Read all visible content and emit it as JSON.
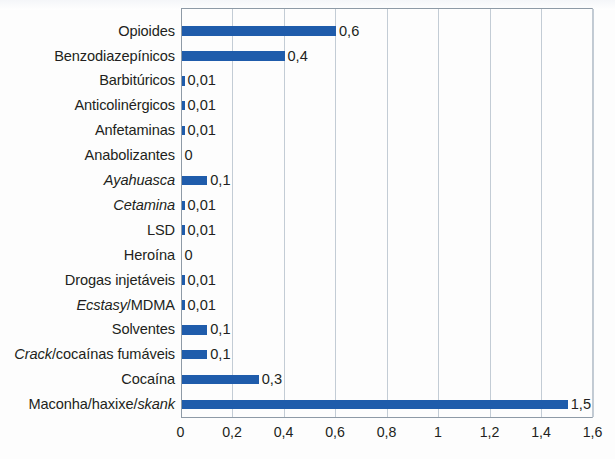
{
  "chart_data": {
    "type": "bar",
    "orientation": "horizontal",
    "title": "",
    "subtitle": "",
    "xlabel": "",
    "ylabel": "",
    "xlim": [
      0,
      1.6
    ],
    "xticks": [
      "0",
      "0,2",
      "0,4",
      "0,6",
      "0,8",
      "1",
      "1,2",
      "1,4",
      "1,6"
    ],
    "xtick_values": [
      0,
      0.2,
      0.4,
      0.6,
      0.8,
      1,
      1.2,
      1.4,
      1.6
    ],
    "grid": "vertical",
    "legend": "none",
    "decimal_separator": ",",
    "bar_color": "#1f5cab",
    "categories": [
      "Opioides",
      "Benzodiazepínicos",
      "Barbitúricos",
      "Anticolinérgicos",
      "Anfetaminas",
      "Anabolizantes",
      "Ayahuasca",
      "Cetamina",
      "LSD",
      "Heroína",
      "Drogas injetáveis",
      "Ecstasy/MDMA",
      "Solventes",
      "Crack/cocaínas fumáveis",
      "Cocaína",
      "Maconha/haxixe/skank"
    ],
    "values": [
      0.6,
      0.4,
      0.01,
      0.01,
      0.01,
      0,
      0.1,
      0.01,
      0.01,
      0,
      0.01,
      0.01,
      0.1,
      0.1,
      0.3,
      1.5
    ],
    "value_labels": [
      "0,6",
      "0,4",
      "0,01",
      "0,01",
      "0,01",
      "0",
      "0,1",
      "0,01",
      "0,01",
      "0",
      "0,01",
      "0,01",
      "0,1",
      "0,1",
      "0,3",
      "1,5"
    ],
    "rows": [
      {
        "label_plain": "Opioides",
        "label_italic": "",
        "label_tail": "",
        "value": 0.6,
        "value_label": "0,6"
      },
      {
        "label_plain": "Benzodiazepínicos",
        "label_italic": "",
        "label_tail": "",
        "value": 0.4,
        "value_label": "0,4"
      },
      {
        "label_plain": "Barbitúricos",
        "label_italic": "",
        "label_tail": "",
        "value": 0.01,
        "value_label": "0,01"
      },
      {
        "label_plain": "Anticolinérgicos",
        "label_italic": "",
        "label_tail": "",
        "value": 0.01,
        "value_label": "0,01"
      },
      {
        "label_plain": "Anfetaminas",
        "label_italic": "",
        "label_tail": "",
        "value": 0.01,
        "value_label": "0,01"
      },
      {
        "label_plain": "Anabolizantes",
        "label_italic": "",
        "label_tail": "",
        "value": 0,
        "value_label": "0"
      },
      {
        "label_plain": "",
        "label_italic": "Ayahuasca",
        "label_tail": "",
        "value": 0.1,
        "value_label": "0,1"
      },
      {
        "label_plain": "",
        "label_italic": "Cetamina",
        "label_tail": "",
        "value": 0.01,
        "value_label": "0,01"
      },
      {
        "label_plain": "LSD",
        "label_italic": "",
        "label_tail": "",
        "value": 0.01,
        "value_label": "0,01"
      },
      {
        "label_plain": "Heroína",
        "label_italic": "",
        "label_tail": "",
        "value": 0,
        "value_label": "0"
      },
      {
        "label_plain": "Drogas injetáveis",
        "label_italic": "",
        "label_tail": "",
        "value": 0.01,
        "value_label": "0,01"
      },
      {
        "label_plain": "",
        "label_italic": "Ecstasy",
        "label_tail": "/MDMA",
        "value": 0.01,
        "value_label": "0,01"
      },
      {
        "label_plain": "Solventes",
        "label_italic": "",
        "label_tail": "",
        "value": 0.1,
        "value_label": "0,1"
      },
      {
        "label_plain": "",
        "label_italic": "Crack",
        "label_tail": "/cocaínas fumáveis",
        "value": 0.1,
        "value_label": "0,1"
      },
      {
        "label_plain": "Cocaína",
        "label_italic": "",
        "label_tail": "",
        "value": 0.3,
        "value_label": "0,3"
      },
      {
        "label_plain": "Maconha/haxixe/",
        "label_italic": "skank",
        "label_tail": "",
        "value": 1.5,
        "value_label": "1,5"
      }
    ]
  }
}
